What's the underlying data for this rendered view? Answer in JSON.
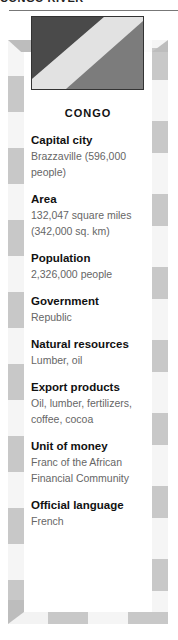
{
  "page": {
    "header_text": "CONGO RIVER"
  },
  "flag": {
    "colors": {
      "upper_left": "#4a4a4a",
      "band": "#e2e2e2",
      "lower_right": "#7c7c7c"
    }
  },
  "card": {
    "title": "CONGO",
    "facts": [
      {
        "label": "Capital city",
        "value": "Brazzaville (596,000 people)"
      },
      {
        "label": "Area",
        "value": "132,047 square miles (342,000 sq. km)"
      },
      {
        "label": "Population",
        "value": "2,326,000 people"
      },
      {
        "label": "Government",
        "value": "Republic"
      },
      {
        "label": "Natural resources",
        "value": "Lumber, oil"
      },
      {
        "label": "Export products",
        "value": "Oil, lumber, fertilizers, coffee, cocoa"
      },
      {
        "label": "Unit of money",
        "value": "Franc of the African Financial Community"
      },
      {
        "label": "Official language",
        "value": "French"
      }
    ]
  },
  "colors": {
    "border_stripe": "#c8c8c8",
    "label_text": "#111111",
    "value_text": "#666666"
  }
}
